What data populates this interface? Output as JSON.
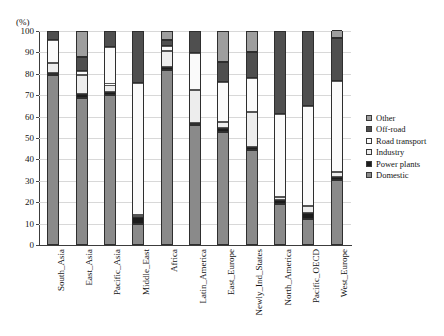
{
  "chart_data": {
    "type": "bar",
    "stacked": true,
    "title": "",
    "subtitle": "",
    "xlabel": "",
    "ylabel": "(%)",
    "unit_label": "(%)",
    "ylim": [
      0,
      100
    ],
    "yticks": [
      0,
      10,
      20,
      30,
      40,
      50,
      60,
      70,
      80,
      90,
      100
    ],
    "ytick_labels": [
      "0",
      "10",
      "20",
      "30",
      "40",
      "50",
      "60",
      "70",
      "80",
      "90",
      "100"
    ],
    "grid": true,
    "legend_position": "right",
    "categories": [
      "South_Asia",
      "East_Asia",
      "Pacific_Asia",
      "Middle_East",
      "Africa",
      "Latin_America",
      "East_Europe",
      "Newly_Ind_States",
      "North_America",
      "Pacific_OECD",
      "West_Europe"
    ],
    "legend_entries": [
      "Other",
      "Off-road",
      "Road transport",
      "Industry",
      "Power plants",
      "Domestic"
    ],
    "series": [
      {
        "name": "Domestic",
        "color": "#8a8a8a",
        "values": [
          79.5,
          68.5,
          70.0,
          10.0,
          82.0,
          56.0,
          53.0,
          44.5,
          19.0,
          12.0,
          30.5
        ]
      },
      {
        "name": "Power plants",
        "color": "#1c1c1c",
        "values": [
          1.0,
          2.0,
          1.5,
          3.0,
          1.0,
          1.0,
          1.5,
          1.5,
          2.0,
          3.0,
          1.5
        ]
      },
      {
        "name": "Industry",
        "color": "#ededed",
        "values": [
          4.5,
          9.0,
          3.5,
          1.0,
          7.5,
          15.5,
          3.0,
          16.0,
          1.5,
          3.0,
          2.0
        ]
      },
      {
        "name": "Road transport",
        "color": "#fafafa",
        "values": [
          11.0,
          2.0,
          17.5,
          61.5,
          2.5,
          17.0,
          18.5,
          16.0,
          38.5,
          47.0,
          42.5
        ]
      },
      {
        "name": "Off-road",
        "color": "#4f4f4f",
        "values": [
          4.0,
          6.5,
          7.5,
          24.5,
          3.0,
          10.5,
          9.5,
          12.0,
          39.0,
          35.0,
          20.0
        ]
      },
      {
        "name": "Other",
        "color": "#9e9e9e",
        "values": [
          0.0,
          12.0,
          0.0,
          0.0,
          4.0,
          0.0,
          14.5,
          10.0,
          0.0,
          0.0,
          4.0
        ]
      }
    ]
  },
  "colors": {
    "other": "#9e9e9e",
    "off_road": "#4f4f4f",
    "road_transport": "#fafafa",
    "industry": "#ededed",
    "power_plants": "#1c1c1c",
    "domestic": "#8a8a8a",
    "axis": "#3c3c3c",
    "grid": "#d8d8d8",
    "text": "#141414",
    "background": "#ffffff"
  }
}
